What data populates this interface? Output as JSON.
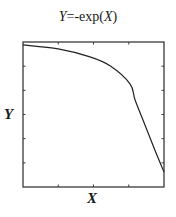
{
  "chart_data": {
    "type": "line",
    "title": "Y=-exp(X)",
    "title_parts": {
      "y_var": "Y",
      "middle": "=-exp(",
      "x_var": "X",
      "end": ")"
    },
    "xlabel": "X",
    "ylabel": "Y",
    "x_tick_labels": [],
    "y_tick_labels": [],
    "x_ticks_count": 3,
    "y_ticks_count": 5,
    "grid": false,
    "legend": null,
    "axis_units": "normalized (no numeric tick labels shown)",
    "xlim": [
      0,
      1
    ],
    "ylim": [
      0,
      1
    ],
    "series": [
      {
        "name": "Y=-exp(X)",
        "color": "#222222",
        "x": [
          0.0,
          0.25,
          0.475,
          0.62,
          0.76,
          0.795,
          0.865,
          0.935,
          1.0
        ],
        "y": [
          0.98,
          0.952,
          0.897,
          0.834,
          0.71,
          0.6,
          0.428,
          0.255,
          0.103
        ]
      }
    ]
  },
  "colors": {
    "axis": "#3a3a3a",
    "curve": "#222222",
    "background": "#ffffff"
  }
}
